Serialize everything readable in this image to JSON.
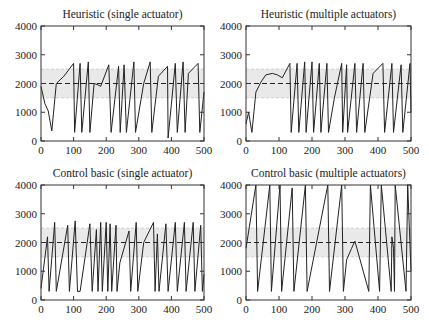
{
  "chart_data": [
    {
      "type": "line",
      "title": "Heuristic (single actuator)",
      "xlabel": "",
      "ylabel": "",
      "xlim": [
        0,
        500
      ],
      "ylim": [
        0,
        4000
      ],
      "xticks": [
        0,
        100,
        200,
        300,
        400,
        500
      ],
      "yticks": [
        0,
        1000,
        2000,
        3000,
        4000
      ],
      "setpoint": 2000,
      "band": [
        1500,
        2500
      ],
      "grid": false,
      "series": [
        {
          "name": "signal",
          "x": [
            0,
            12,
            22,
            33,
            47,
            70,
            100,
            103,
            120,
            125,
            145,
            150,
            163,
            175,
            183,
            208,
            215,
            238,
            243,
            255,
            262,
            285,
            290,
            315,
            335,
            340,
            360,
            388,
            390,
            412,
            418,
            436,
            442,
            452,
            482,
            487,
            500
          ],
          "y": [
            1900,
            1300,
            1050,
            350,
            2000,
            2250,
            2700,
            300,
            2700,
            300,
            2750,
            300,
            2000,
            1950,
            1900,
            2650,
            300,
            2600,
            300,
            2650,
            300,
            2750,
            300,
            2000,
            2750,
            300,
            2250,
            2600,
            100,
            2700,
            300,
            2750,
            300,
            2350,
            2700,
            300,
            1700
          ]
        }
      ]
    },
    {
      "type": "line",
      "title": "Heuristic (multiple actuators)",
      "xlabel": "",
      "ylabel": "",
      "xlim": [
        0,
        500
      ],
      "ylim": [
        0,
        4000
      ],
      "xticks": [
        0,
        100,
        200,
        300,
        400,
        500
      ],
      "yticks": [
        0,
        1000,
        2000,
        3000,
        4000
      ],
      "setpoint": 2000,
      "band": [
        1500,
        2500
      ],
      "grid": false,
      "series": [
        {
          "name": "signal",
          "x": [
            0,
            8,
            18,
            30,
            45,
            60,
            80,
            95,
            110,
            133,
            137,
            155,
            160,
            178,
            182,
            200,
            205,
            222,
            227,
            245,
            250,
            268,
            290,
            293,
            305,
            308,
            330,
            335,
            355,
            360,
            385,
            415,
            420,
            442,
            447,
            470,
            475,
            497,
            500
          ],
          "y": [
            600,
            1000,
            300,
            1700,
            2050,
            2300,
            2350,
            2300,
            2200,
            2700,
            300,
            2700,
            300,
            2750,
            300,
            2750,
            300,
            2700,
            300,
            2700,
            300,
            1500,
            2700,
            300,
            2650,
            300,
            2700,
            300,
            2700,
            300,
            2350,
            2700,
            300,
            2700,
            300,
            2650,
            300,
            2700,
            1000
          ]
        }
      ]
    },
    {
      "type": "line",
      "title": "Control basic (single actuator)",
      "xlabel": "",
      "ylabel": "",
      "xlim": [
        0,
        500
      ],
      "ylim": [
        0,
        4000
      ],
      "xticks": [
        0,
        100,
        200,
        300,
        400,
        500
      ],
      "yticks": [
        0,
        1000,
        2000,
        3000,
        4000
      ],
      "setpoint": 2000,
      "band": [
        1500,
        2500
      ],
      "grid": false,
      "series": [
        {
          "name": "signal",
          "x": [
            0,
            20,
            25,
            42,
            47,
            82,
            87,
            105,
            112,
            120,
            150,
            157,
            170,
            175,
            183,
            188,
            200,
            205,
            212,
            217,
            230,
            233,
            242,
            270,
            275,
            292,
            297,
            315,
            345,
            350,
            357,
            362,
            383,
            390,
            412,
            418,
            440,
            445,
            467,
            472,
            490,
            495,
            500
          ],
          "y": [
            400,
            2200,
            300,
            2700,
            300,
            2600,
            300,
            2750,
            300,
            300,
            2650,
            300,
            2450,
            300,
            2700,
            300,
            2700,
            300,
            2650,
            300,
            2600,
            300,
            1300,
            2400,
            300,
            2700,
            300,
            2000,
            2700,
            300,
            2300,
            300,
            2650,
            300,
            2700,
            300,
            2700,
            300,
            2700,
            300,
            2600,
            300,
            900
          ]
        }
      ]
    },
    {
      "type": "line",
      "title": "Control basic (multiple actuators)",
      "xlabel": "",
      "ylabel": "",
      "xlim": [
        0,
        500
      ],
      "ylim": [
        0,
        4000
      ],
      "xticks": [
        0,
        100,
        200,
        300,
        400,
        500
      ],
      "yticks": [
        0,
        1000,
        2000,
        3000,
        4000
      ],
      "setpoint": 2000,
      "band": [
        1500,
        2500
      ],
      "grid": false,
      "series": [
        {
          "name": "signal",
          "x": [
            0,
            30,
            35,
            72,
            77,
            103,
            108,
            140,
            145,
            180,
            185,
            248,
            253,
            290,
            295,
            305,
            320,
            330,
            372,
            377,
            405,
            410,
            440,
            442,
            447,
            450,
            452,
            485,
            490,
            500
          ],
          "y": [
            1800,
            4000,
            300,
            4000,
            300,
            4000,
            300,
            3900,
            300,
            4000,
            300,
            4000,
            300,
            4000,
            300,
            1400,
            1800,
            2050,
            300,
            4000,
            300,
            4000,
            300,
            2200,
            1800,
            300,
            4000,
            300,
            4000,
            1000
          ]
        }
      ]
    }
  ]
}
